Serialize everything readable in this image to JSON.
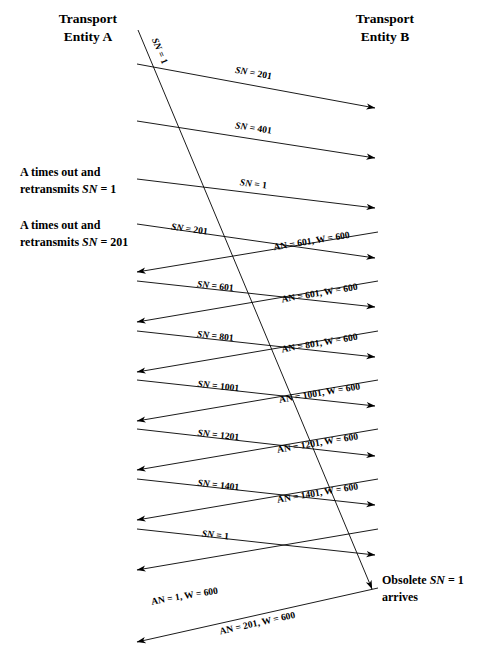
{
  "diagram": {
    "title_left": "Transport\nEntity A",
    "title_right": "Transport\nEntity B",
    "entity_a": {
      "line1": "Transport",
      "line2": "Entity A"
    },
    "entity_b": {
      "line1": "Transport",
      "line2": "Entity B"
    },
    "notes": [
      {
        "id": "note-timeout-1",
        "line1": "A times out and",
        "line2_prefix": "retransmits ",
        "line2_italic": "SN",
        "line2_suffix": " = 1"
      },
      {
        "id": "note-timeout-201",
        "line1": "A times out and",
        "line2_prefix": "retransmits ",
        "line2_italic": "SN",
        "line2_suffix": " = 201"
      },
      {
        "id": "note-obsolete",
        "line1_prefix": "Obsolete ",
        "line1_italic": "SN",
        "line1_suffix": " = 1",
        "line2": "arrives"
      }
    ],
    "messages_a_to_b": [
      {
        "id": "msg-sn-1-lost",
        "italic": "SN",
        "rest": " = 1",
        "kind": "lost-segment"
      },
      {
        "id": "msg-sn-201",
        "italic": "SN",
        "rest": " = 201"
      },
      {
        "id": "msg-sn-401",
        "italic": "SN",
        "rest": " = 401"
      },
      {
        "id": "msg-sn-1-retransmit",
        "italic": "SN",
        "rest": " = 1"
      },
      {
        "id": "msg-sn-201-retransmit",
        "italic": "SN",
        "rest": " = 201"
      },
      {
        "id": "msg-sn-601",
        "italic": "SN",
        "rest": " = 601"
      },
      {
        "id": "msg-sn-801",
        "italic": "SN",
        "rest": " = 801"
      },
      {
        "id": "msg-sn-1001",
        "italic": "SN",
        "rest": " = 1001"
      },
      {
        "id": "msg-sn-1201",
        "italic": "SN",
        "rest": " = 1201"
      },
      {
        "id": "msg-sn-1401",
        "italic": "SN",
        "rest": " = 1401"
      },
      {
        "id": "msg-sn-1-final",
        "italic": "SN",
        "rest": " = 1"
      }
    ],
    "messages_b_to_a": [
      {
        "id": "ack-601-a",
        "text": "AN = 601, W = 600"
      },
      {
        "id": "ack-601-b",
        "text": "AN = 601, W = 600"
      },
      {
        "id": "ack-801",
        "text": "AN = 801, W = 600"
      },
      {
        "id": "ack-1001",
        "text": "AN = 1001, W = 600"
      },
      {
        "id": "ack-1201",
        "text": "AN = 1201, W = 600"
      },
      {
        "id": "ack-1401",
        "text": "AN = 1401, W = 600"
      },
      {
        "id": "ack-1",
        "text": "AN = 1, W = 600"
      },
      {
        "id": "ack-201",
        "text": "AN = 201, W = 600"
      }
    ],
    "label_texts": {
      "sn_1_diag": "SN = 1",
      "sn_201": "SN = 201",
      "sn_401": "SN = 401",
      "sn_1_rx": "SN = 1",
      "sn_201_rx": "SN = 201",
      "sn_601": "SN = 601",
      "sn_801": "SN = 801",
      "sn_1001": "SN = 1001",
      "sn_1201": "SN = 1201",
      "sn_1401": "SN = 1401",
      "sn_1_final": "SN = 1",
      "an_601_a": "AN = 601, W = 600",
      "an_601_b": "AN = 601, W = 600",
      "an_801": "AN = 801, W = 600",
      "an_1001": "AN = 1001, W = 600",
      "an_1201": "AN = 1201, W = 600",
      "an_1401": "AN = 1401, W = 600",
      "an_1": "AN = 1, W = 600",
      "an_201": "AN = 201, W = 600"
    },
    "colors": {
      "stroke": "#000000",
      "background": "#ffffff",
      "text": "#000000"
    }
  }
}
